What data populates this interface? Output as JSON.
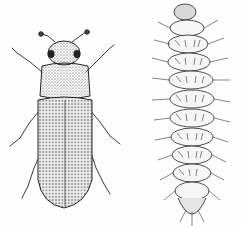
{
  "illustration": {
    "style": "black-and-white stippled line drawing",
    "background_color": "#fefefe",
    "ink_color": "#222222",
    "figures": [
      {
        "name": "adult-beetle",
        "position": "left"
      },
      {
        "name": "larva",
        "position": "right"
      }
    ]
  }
}
